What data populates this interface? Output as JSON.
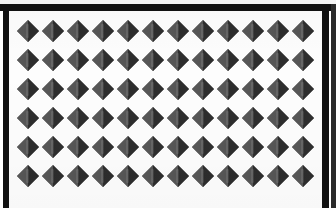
{
  "image": {
    "subject": "diamond-pyramid-texture-swatch",
    "description": "Repeating grid of dark gray four-faceted pyramid diamond shapes on a white background, enclosed by a black printed frame",
    "background_color": "#fdfdfd",
    "frame_color": "#111111"
  },
  "frame": {
    "top_label": "top-border",
    "left_label": "left-border",
    "right_label": "right-border",
    "highlight_label": "top-highlight-strip"
  },
  "pattern": {
    "shape_name": "four-facet-pyramid-diamond",
    "columns": 12,
    "rows": 6,
    "shape_width_px": 22,
    "shape_height_px": 22,
    "column_pitch_px": 25,
    "row_pitch_px": 29,
    "origin_x_px": 8,
    "origin_y_px": 9,
    "facet_colors": {
      "top": "#6f6f6f",
      "left": "#585858",
      "right": "#2e2e2e",
      "bottom": "#3a3a3a"
    },
    "cell_label": "diamond-shape"
  }
}
